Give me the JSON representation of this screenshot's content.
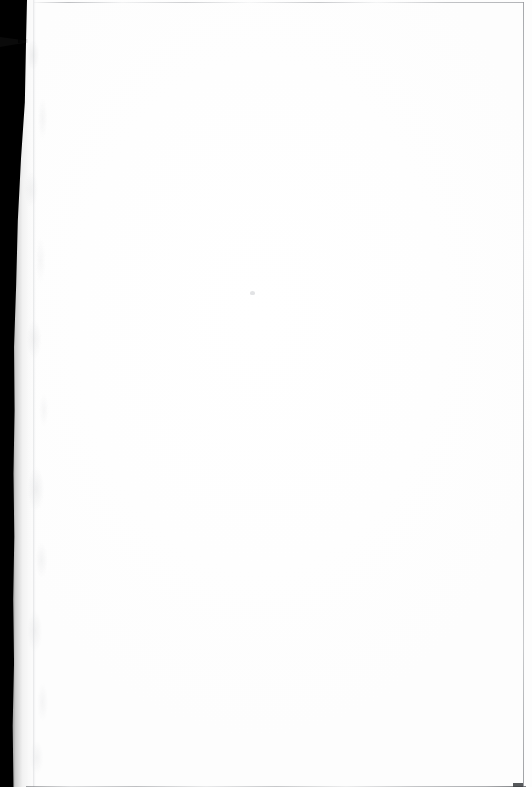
{
  "document": {
    "kind": "scanned-page",
    "content_state": "blank",
    "body_text": "",
    "page_width": 532,
    "page_height": 791
  },
  "scan": {
    "gutter_label": "scan-gutter-shadow",
    "notch_label": "gutter-notch-artifact",
    "texture_label": "gutter-paper-texture",
    "speck_label": "dust-speck"
  },
  "edges": {
    "top_rule_label": "page-edge-top",
    "right_rule_label": "page-edge-right",
    "bottom_rule_label": "page-edge-bottom",
    "corner_mark_label": "corner-nick-bottom-right"
  },
  "colors": {
    "paper": "#fefefe",
    "gutter": "#000000",
    "edge_rule": "#a8aaae",
    "speck": "#ced0d4",
    "corner_mark": "#3a3c40"
  }
}
